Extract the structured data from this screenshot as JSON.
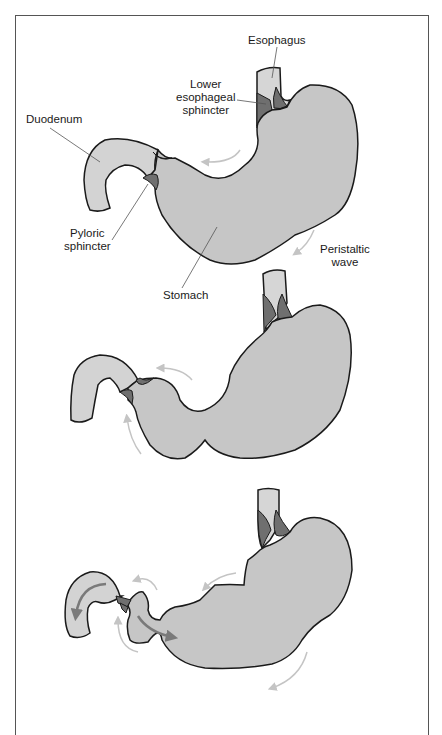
{
  "figure": {
    "panels": [
      {
        "id": "panel-1",
        "description": "Stomach at rest with sphincters closed; peristaltic wave begins"
      },
      {
        "id": "panel-2",
        "description": "Peristaltic wave moves toward pylorus"
      },
      {
        "id": "panel-3",
        "description": "Pyloric sphincter opens; chyme passes into duodenum, remainder pushed back"
      }
    ],
    "labels": {
      "esophagus": "Esophagus",
      "lower_esophageal_sphincter": [
        "Lower",
        "esophageal",
        "sphincter"
      ],
      "duodenum": "Duodenum",
      "pyloric_sphincter": [
        "Pyloric",
        "sphincter"
      ],
      "stomach": "Stomach",
      "peristaltic_wave": [
        "Peristaltic",
        "wave"
      ]
    }
  },
  "colors": {
    "stomach_fill": "#c6c6c6",
    "duodenum_fill": "#d3d3d3",
    "esophagus_fill": "#d6d6d6",
    "sphincter_fill": "#6f6f6f",
    "outline": "#1a1a1a",
    "faint_arrow": "#c4c4c4",
    "bold_arrow": "#7a7a7a",
    "leader_line": "#555555",
    "frame": "#555555"
  }
}
